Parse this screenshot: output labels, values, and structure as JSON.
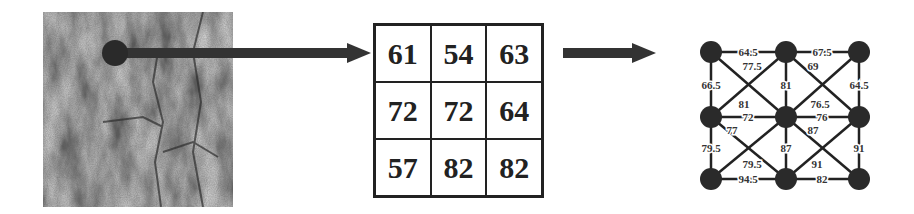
{
  "texture_image": {
    "description": "grayscale tree bark texture patch",
    "sample_point": {
      "x": 115,
      "y": 53
    }
  },
  "pixel_grid": {
    "rows": [
      [
        "61",
        "54",
        "63"
      ],
      [
        "72",
        "72",
        "64"
      ],
      [
        "57",
        "82",
        "82"
      ]
    ]
  },
  "graph": {
    "nodes": [
      {
        "id": "n00",
        "x": 711,
        "y": 52
      },
      {
        "id": "n01",
        "x": 786,
        "y": 52
      },
      {
        "id": "n02",
        "x": 859,
        "y": 52
      },
      {
        "id": "n10",
        "x": 711,
        "y": 117
      },
      {
        "id": "n11",
        "x": 786,
        "y": 117
      },
      {
        "id": "n12",
        "x": 859,
        "y": 117
      },
      {
        "id": "n20",
        "x": 711,
        "y": 179
      },
      {
        "id": "n21",
        "x": 786,
        "y": 179
      },
      {
        "id": "n22",
        "x": 859,
        "y": 179
      }
    ],
    "edges": [
      {
        "from": "n00",
        "to": "n01",
        "weight": "64.5",
        "lx": 748,
        "ly": 56
      },
      {
        "from": "n01",
        "to": "n02",
        "weight": "67.5",
        "lx": 822,
        "ly": 56
      },
      {
        "from": "n00",
        "to": "n10",
        "weight": "66.5",
        "lx": 711,
        "ly": 89
      },
      {
        "from": "n01",
        "to": "n11",
        "weight": "81",
        "lx": 786,
        "ly": 89
      },
      {
        "from": "n02",
        "to": "n12",
        "weight": "64.5",
        "lx": 859,
        "ly": 89
      },
      {
        "from": "n00",
        "to": "n11",
        "weight": "77.5",
        "lx": 752,
        "ly": 70
      },
      {
        "from": "n01",
        "to": "n12",
        "weight": "69",
        "lx": 813,
        "ly": 70
      },
      {
        "from": "n10",
        "to": "n01",
        "weight": "81",
        "lx": 744,
        "ly": 108
      },
      {
        "from": "n11",
        "to": "n02",
        "weight": "76.5",
        "lx": 820,
        "ly": 108
      },
      {
        "from": "n10",
        "to": "n11",
        "weight": "72",
        "lx": 748,
        "ly": 121
      },
      {
        "from": "n11",
        "to": "n12",
        "weight": "76",
        "lx": 822,
        "ly": 121
      },
      {
        "from": "n10",
        "to": "n21",
        "weight": "77",
        "lx": 732,
        "ly": 134
      },
      {
        "from": "n11",
        "to": "n22",
        "weight": "87",
        "lx": 813,
        "ly": 134
      },
      {
        "from": "n10",
        "to": "n20",
        "weight": "79.5",
        "lx": 711,
        "ly": 152
      },
      {
        "from": "n11",
        "to": "n21",
        "weight": "87",
        "lx": 786,
        "ly": 152
      },
      {
        "from": "n12",
        "to": "n22",
        "weight": "91",
        "lx": 859,
        "ly": 152
      },
      {
        "from": "n20",
        "to": "n11",
        "weight": "79.5",
        "lx": 752,
        "ly": 168
      },
      {
        "from": "n21",
        "to": "n12",
        "weight": "91",
        "lx": 817,
        "ly": 168
      },
      {
        "from": "n20",
        "to": "n21",
        "weight": "94.5",
        "lx": 748,
        "ly": 183
      },
      {
        "from": "n21",
        "to": "n22",
        "weight": "82",
        "lx": 822,
        "ly": 183
      }
    ]
  },
  "colors": {
    "ink": "#222222",
    "node_fill": "#2a2a2a",
    "arrow": "#333333",
    "background": "#ffffff"
  }
}
